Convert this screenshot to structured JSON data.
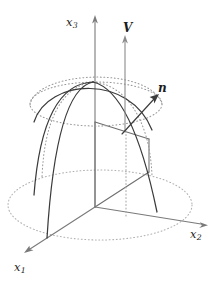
{
  "figure": {
    "background_color": "#ffffff",
    "width": 219,
    "height": 283
  },
  "axes": {
    "origin": {
      "x": 95,
      "y": 207
    },
    "items": [
      {
        "id": "x3",
        "label": "x",
        "subscript": "3",
        "direction": "vertical-up",
        "color": "#7a7a7a",
        "tip": {
          "x": 95,
          "y": 17
        }
      },
      {
        "id": "x2",
        "label": "x",
        "subscript": "2",
        "direction": "right-down",
        "color": "#7a7a7a",
        "tip": {
          "x": 206,
          "y": 226
        }
      },
      {
        "id": "x1",
        "label": "x",
        "subscript": "1",
        "direction": "left-down",
        "color": "#7a7a7a",
        "tip": {
          "x": 25,
          "y": 253
        }
      }
    ]
  },
  "vectors": [
    {
      "id": "V",
      "label": "V",
      "style": "bold-italic",
      "color": "#8a8a8a",
      "description": "vertical velocity vector",
      "tail": {
        "x": 125,
        "y": 132
      },
      "tip": {
        "x": 125,
        "y": 37
      }
    },
    {
      "id": "n",
      "label": "n",
      "style": "bold-italic",
      "color": "#3c3c3c",
      "description": "outward surface normal vector",
      "tail": {
        "x": 126,
        "y": 131
      },
      "tip": {
        "x": 158,
        "y": 95
      }
    }
  ],
  "surface": {
    "type": "dome",
    "apex": {
      "x": 93,
      "y": 82
    },
    "line_color": "#3a3a3a",
    "dotted_color": "#9a9a9a",
    "meridian_count": 4,
    "ground_ellipse": {
      "center_x": 100,
      "center_y": 205,
      "radius_x": 92,
      "radius_y": 35,
      "style": "dotted"
    },
    "waist_ellipse": {
      "center_x": 96,
      "center_y": 104,
      "radius_x": 66,
      "radius_y": 22,
      "style": "dotted"
    }
  },
  "plane": {
    "description": "vertical cutting plane through the dome",
    "edge_color": "#6e6e6e"
  }
}
